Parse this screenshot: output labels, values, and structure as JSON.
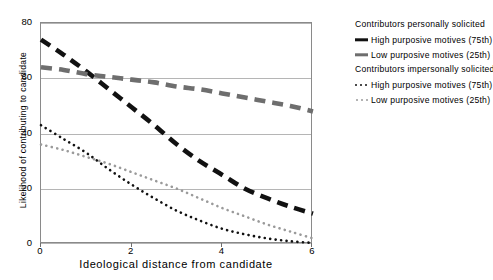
{
  "chart_data": {
    "type": "line",
    "title": "",
    "xlabel": "Ideological distance from candidate",
    "ylabel": "Likelihood of contributing to candidate",
    "xlim": [
      0,
      6
    ],
    "ylim": [
      0,
      80
    ],
    "xticks": [
      "0",
      "2",
      "4",
      "6"
    ],
    "yticks": [
      "0",
      "20",
      "40",
      "60",
      "80"
    ],
    "grid": "horizontal",
    "legend_position": "right",
    "x": [
      0,
      0.5,
      1,
      1.5,
      2,
      2.5,
      3,
      3.5,
      4,
      4.5,
      5,
      5.5,
      6
    ],
    "series": [
      {
        "name": "High purposive motives (75th)",
        "group": "Contributors personally solicited",
        "style": "thick-dashed",
        "color": "#111111",
        "values": [
          74,
          68.5,
          62.5,
          56,
          49.5,
          43,
          36,
          30,
          25,
          20,
          16.5,
          13.5,
          11
        ]
      },
      {
        "name": "Low purposive motives (25th)",
        "group": "Contributors personally solicited",
        "style": "thick-dashed",
        "color": "#6e6e6e",
        "values": [
          64,
          63,
          61.5,
          60.5,
          59.5,
          58.5,
          57,
          56,
          54.5,
          53,
          51.5,
          50,
          48
        ]
      },
      {
        "name": "High purposive motives (75th)",
        "group": "Contributors impersonally solicited",
        "style": "dotted",
        "color": "#111111",
        "values": [
          43,
          38,
          33,
          27,
          21.5,
          16.5,
          12,
          8.5,
          5.5,
          3.5,
          2,
          1,
          0.4
        ]
      },
      {
        "name": "Low purposive motives (25th)",
        "group": "Contributors impersonally solicited",
        "style": "dotted",
        "color": "#9a9a9a",
        "values": [
          36,
          34,
          31.5,
          29,
          26,
          23,
          20,
          16.5,
          13,
          10,
          7,
          4.5,
          2
        ]
      }
    ]
  },
  "axes": {
    "x_title": "Ideological distance from candidate",
    "y_title": "Likelihood of contributing to candidate",
    "x_ticks": [
      "0",
      "2",
      "4",
      "6"
    ],
    "y_ticks": [
      "80",
      "60",
      "40",
      "20",
      "0"
    ]
  },
  "legend": {
    "group1_header": "Contributors personally solicited",
    "group1_items": [
      {
        "label": "High purposive motives (75th)",
        "swatch": "thick-dash-black"
      },
      {
        "label": "Low purposive motives (25th)",
        "swatch": "thick-dash-gray"
      }
    ],
    "group2_header": "Contributors impersonally solicited",
    "group2_items": [
      {
        "label": "High purposive motives (75th)",
        "swatch": "dotted-black"
      },
      {
        "label": "Low purposive motives (25th)",
        "swatch": "dotted-gray"
      }
    ]
  }
}
